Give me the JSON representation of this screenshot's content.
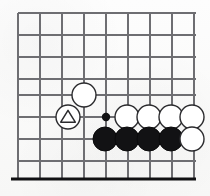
{
  "figure": {
    "kind": "go-board-diagram",
    "width": 210,
    "height": 196,
    "background_color": "#fbfbfa"
  },
  "board": {
    "grid_origin_x": 18,
    "grid_origin_y": 13,
    "grid_spacing": 22,
    "columns": 9,
    "rows": 8,
    "line_color": "#6e6e72",
    "line_width": 1.15,
    "edge": {
      "side": "bottom",
      "y": 179,
      "x_start": 11,
      "x_end": 196,
      "color": "#111113",
      "width": 3.2
    },
    "vertical_lines_x": [
      18,
      40,
      62,
      84,
      106,
      128,
      150,
      172,
      194
    ],
    "horizontal_lines_y": [
      13,
      35,
      57,
      79,
      95,
      117,
      139,
      161
    ],
    "horizontal_line_x_start": 18,
    "horizontal_line_x_end": 196,
    "vertical_line_y_start": 13,
    "vertical_line_y_end": 179
  },
  "stones": {
    "radius": 12,
    "black_color": "#121214",
    "white_color": "#ffffff",
    "white_outline_color": "#2b2b2e",
    "items": [
      {
        "id": "white-upper-approach",
        "color": "white",
        "cx": 84,
        "cy": 95,
        "marker": "none"
      },
      {
        "id": "white-triangle-marked",
        "color": "white",
        "cx": 68,
        "cy": 117,
        "marker": "triangle"
      },
      {
        "id": "white-row-1",
        "color": "white",
        "cx": 127,
        "cy": 117,
        "marker": "none"
      },
      {
        "id": "white-row-2",
        "color": "white",
        "cx": 149,
        "cy": 117,
        "marker": "none"
      },
      {
        "id": "white-row-3",
        "color": "white",
        "cx": 171,
        "cy": 117,
        "marker": "none"
      },
      {
        "id": "white-row-4",
        "color": "white",
        "cx": 192,
        "cy": 117,
        "marker": "none"
      },
      {
        "id": "black-row-1",
        "color": "black",
        "cx": 105,
        "cy": 139,
        "marker": "none"
      },
      {
        "id": "black-row-2",
        "color": "black",
        "cx": 127,
        "cy": 139,
        "marker": "none"
      },
      {
        "id": "black-row-3",
        "color": "black",
        "cx": 149,
        "cy": 139,
        "marker": "none"
      },
      {
        "id": "black-row-4",
        "color": "black",
        "cx": 171,
        "cy": 139,
        "marker": "none"
      },
      {
        "id": "white-row-5",
        "color": "white",
        "cx": 192,
        "cy": 139,
        "marker": "none"
      }
    ]
  },
  "markers": {
    "point_dot": {
      "id": "black-point-dot",
      "cx": 106,
      "cy": 117,
      "radius": 4.2,
      "color": "#121214",
      "meaning": "marked point"
    },
    "triangle": {
      "size": 13,
      "stroke_color": "#2b2b2e",
      "meaning": "triangle-marked white stone"
    }
  }
}
